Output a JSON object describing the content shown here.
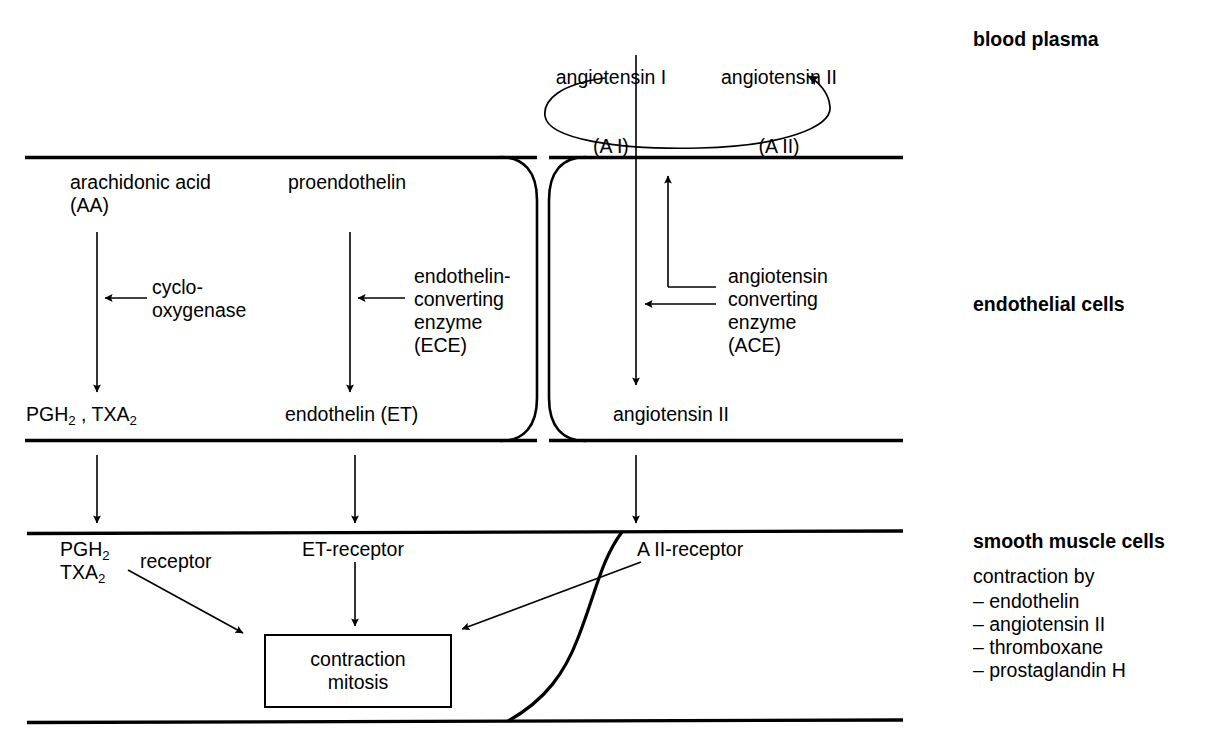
{
  "diagram": {
    "line_color": "#000000",
    "background": "#ffffff"
  },
  "plasma": {
    "angiotensin_I": {
      "name": "angiotensin I",
      "abbrev": "(A I)"
    },
    "angiotensin_II": {
      "name": "angiotensin II",
      "abbrev": "(A II)"
    }
  },
  "endothelium": {
    "cell1": {
      "substrate_a": {
        "name": "arachidonic acid",
        "abbrev": "(AA)"
      },
      "enzyme_a_line1": "cyclo-",
      "enzyme_a_line2": "oxygenase",
      "product_a": "PGH₂ , TXA₂",
      "product_a_parts": {
        "pgh": "PGH",
        "pgh_sub": "2",
        "sep": " , ",
        "txa": "TXA",
        "txa_sub": "2"
      },
      "substrate_b": "proendothelin",
      "enzyme_b_line1": "endothelin-",
      "enzyme_b_line2": "converting",
      "enzyme_b_line3": "enzyme",
      "enzyme_b_line4": "(ECE)",
      "product_b": "endothelin (ET)"
    },
    "cell2": {
      "enzyme_line1": "angiotensin",
      "enzyme_line2": "converting",
      "enzyme_line3": "enzyme",
      "enzyme_line4": "(ACE)",
      "product": "angiotensin II"
    }
  },
  "smooth_muscle": {
    "receptor_pgh_line1": "PGH₂",
    "receptor_pgh_line2": "TXA₂",
    "receptor_pgh_word": "receptor",
    "receptor_et": "ET-receptor",
    "receptor_aii": "A II-receptor",
    "effect_box_line1": "contraction",
    "effect_box_line2": "mitosis"
  },
  "side_labels": {
    "plasma": "blood plasma",
    "endothelium": "endothelial cells",
    "smooth_muscle": "smooth muscle cells",
    "contraction_by": "contraction by",
    "agonists": [
      "– endothelin",
      "– angiotensin II",
      "– thromboxane",
      "– prostaglandin H"
    ]
  }
}
